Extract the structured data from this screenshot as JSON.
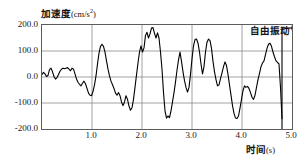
{
  "chart_data": {
    "type": "line",
    "title": "",
    "ylabel_cjk": "加速度",
    "ylabel_unit": "(cm/s",
    "ylabel_unit_sup": "2",
    "ylabel_unit_tail": ")",
    "ylabel_full": "加速度(cm/s²)",
    "xlabel_cjk": "时间",
    "xlabel_unit": "(s)",
    "xlabel_full": "时间(s)",
    "xlim": [
      0.0,
      5.0
    ],
    "ylim": [
      -200.0,
      200.0
    ],
    "grid": true,
    "legend_position": "none",
    "xticks": [
      1.0,
      2.0,
      3.0,
      4.0,
      5.0
    ],
    "xtick_labels": [
      "1.0",
      "2.0",
      "3.0",
      "4.0",
      "5.0"
    ],
    "yticks": [
      200.0,
      100.0,
      0.0,
      -100.0,
      -200.0
    ],
    "ytick_labels": [
      "200.0",
      "100.0",
      "0.0",
      "-100.0",
      "-200.0"
    ],
    "annotations": [
      {
        "text": "自由振动",
        "x": 4.8,
        "marker": "vertical-line-with-right-arrow",
        "note": "free vibration region begins at t=4.8 s"
      }
    ],
    "series": [
      {
        "name": "acceleration",
        "color": "#000000",
        "x": [
          0.0,
          0.03,
          0.06,
          0.09,
          0.12,
          0.15,
          0.18,
          0.21,
          0.24,
          0.27,
          0.3,
          0.33,
          0.36,
          0.39,
          0.42,
          0.45,
          0.48,
          0.51,
          0.54,
          0.57,
          0.6,
          0.63,
          0.66,
          0.69,
          0.72,
          0.75,
          0.78,
          0.81,
          0.84,
          0.87,
          0.9,
          0.93,
          0.96,
          0.99,
          1.02,
          1.05,
          1.08,
          1.11,
          1.14,
          1.17,
          1.2,
          1.23,
          1.26,
          1.29,
          1.32,
          1.35,
          1.38,
          1.41,
          1.44,
          1.47,
          1.5,
          1.53,
          1.56,
          1.59,
          1.62,
          1.65,
          1.68,
          1.71,
          1.74,
          1.77,
          1.8,
          1.83,
          1.86,
          1.89,
          1.92,
          1.95,
          1.98,
          2.01,
          2.04,
          2.07,
          2.1,
          2.13,
          2.16,
          2.19,
          2.22,
          2.25,
          2.28,
          2.31,
          2.34,
          2.37,
          2.4,
          2.43,
          2.46,
          2.49,
          2.52,
          2.55,
          2.58,
          2.61,
          2.64,
          2.67,
          2.7,
          2.73,
          2.76,
          2.79,
          2.82,
          2.85,
          2.88,
          2.91,
          2.94,
          2.97,
          3.0,
          3.03,
          3.06,
          3.09,
          3.12,
          3.15,
          3.18,
          3.21,
          3.24,
          3.27,
          3.3,
          3.33,
          3.36,
          3.39,
          3.42,
          3.45,
          3.48,
          3.51,
          3.54,
          3.57,
          3.6,
          3.63,
          3.66,
          3.69,
          3.72,
          3.75,
          3.78,
          3.81,
          3.84,
          3.87,
          3.9,
          3.93,
          3.96,
          3.99,
          4.02,
          4.05,
          4.08,
          4.11,
          4.14,
          4.17,
          4.2,
          4.23,
          4.26,
          4.29,
          4.32,
          4.35,
          4.38,
          4.41,
          4.44,
          4.47,
          4.5,
          4.53,
          4.56,
          4.59,
          4.62,
          4.65,
          4.68,
          4.71,
          4.74,
          4.77,
          4.8
        ],
        "y": [
          10,
          18,
          12,
          2,
          6,
          28,
          34,
          20,
          2,
          -8,
          -2,
          10,
          22,
          30,
          34,
          32,
          34,
          36,
          30,
          24,
          34,
          30,
          12,
          -8,
          -20,
          -28,
          -34,
          -24,
          -16,
          -26,
          -44,
          -62,
          -70,
          -72,
          -56,
          -30,
          4,
          50,
          92,
          118,
          126,
          118,
          96,
          62,
          30,
          4,
          -16,
          -30,
          -44,
          -62,
          -70,
          -60,
          -72,
          -96,
          -110,
          -96,
          -72,
          -86,
          -112,
          -128,
          -118,
          -86,
          -40,
          8,
          54,
          96,
          120,
          96,
          112,
          160,
          172,
          150,
          166,
          188,
          190,
          168,
          150,
          170,
          150,
          96,
          30,
          -60,
          -130,
          -158,
          -150,
          -156,
          -130,
          -96,
          -60,
          -20,
          26,
          66,
          96,
          60,
          20,
          -14,
          -40,
          -58,
          -40,
          10,
          70,
          120,
          144,
          146,
          130,
          96,
          50,
          12,
          40,
          96,
          134,
          146,
          140,
          110,
          60,
          20,
          -10,
          -34,
          -30,
          -6,
          16,
          40,
          58,
          44,
          10,
          -30,
          -70,
          -110,
          -140,
          -158,
          -160,
          -150,
          -120,
          -86,
          -52,
          -34,
          -40,
          -36,
          -44,
          -60,
          -78,
          -86,
          -70,
          -40,
          -10,
          14,
          40,
          54,
          62,
          86,
          110,
          126,
          130,
          118,
          96,
          78,
          62,
          56,
          50,
          -40,
          -160
        ]
      }
    ]
  }
}
